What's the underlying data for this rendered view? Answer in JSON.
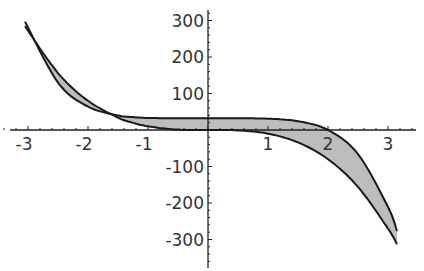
{
  "chart_data": {
    "type": "area",
    "title": "",
    "xlabel": "",
    "ylabel": "",
    "xlim": [
      -3.1,
      3.25
    ],
    "ylim": [
      -370,
      320
    ],
    "grid": false,
    "legend": null,
    "x_ticks": [
      -3,
      -2,
      -1,
      1,
      2,
      3
    ],
    "x_tick_labels": [
      "-3",
      "-2",
      "-1",
      "1",
      "2",
      "3"
    ],
    "y_ticks": [
      300,
      200,
      100,
      -100,
      -200,
      -300
    ],
    "y_tick_labels": [
      "300",
      "200",
      "100",
      "-100",
      "-200",
      "-300"
    ],
    "series": [
      {
        "name": "curve-a",
        "description": "approx. y = -10x^3",
        "x": [
          -3.05,
          -2.5,
          -2,
          -1.5,
          -1.3,
          -1,
          -0.5,
          0,
          0.5,
          1,
          1.5,
          2,
          2.5,
          3,
          3.15
        ],
        "values": [
          284,
          156,
          80,
          34,
          22,
          10,
          1,
          0,
          -1,
          -10,
          -34,
          -80,
          -156,
          -270,
          -313
        ]
      },
      {
        "name": "curve-b",
        "description": "approx. y = 32 - x^5",
        "x": [
          -3.05,
          -2.5,
          -2,
          -1.5,
          -1.3,
          -1,
          -0.5,
          0,
          0.5,
          1,
          1.5,
          2,
          2.5,
          3,
          3.15
        ],
        "values": [
          297,
          130,
          64,
          40,
          36,
          33,
          32,
          32,
          32,
          31,
          24,
          0,
          -66,
          -211,
          -277
        ]
      }
    ],
    "fill_between": true,
    "fill_color": "#bdbdbd",
    "line_color": "#1a1a1a"
  }
}
